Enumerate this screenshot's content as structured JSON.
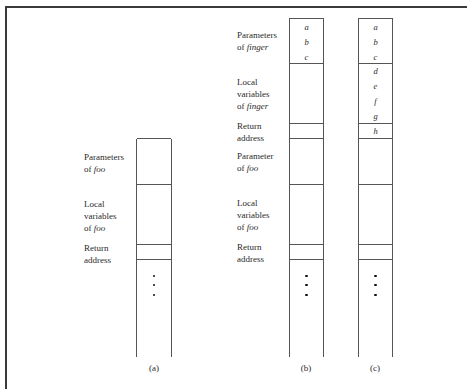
{
  "figure": {
    "columns": [
      {
        "id": "a",
        "caption": "(a)",
        "sections": [
          {
            "label_main": "Parameters",
            "label_prefix": "of ",
            "label_italic": "foo"
          },
          {
            "label_main": "Local\nvariables",
            "label_prefix": "of ",
            "label_italic": "foo"
          },
          {
            "label_main": "Return\naddress",
            "label_prefix": "",
            "label_italic": ""
          }
        ]
      },
      {
        "id": "b",
        "caption": "(b)",
        "sections": [
          {
            "label_main": "Parameters",
            "label_prefix": "of ",
            "label_italic": "finger",
            "vars": [
              "a",
              "b",
              "c"
            ]
          },
          {
            "label_main": "Local\nvariables",
            "label_prefix": "of ",
            "label_italic": "finger"
          },
          {
            "label_main": "Return\naddress",
            "label_prefix": "",
            "label_italic": ""
          },
          {
            "label_main": "Parameter",
            "label_prefix": "of ",
            "label_italic": "foo"
          },
          {
            "label_main": "Local\nvariables",
            "label_prefix": "of ",
            "label_italic": "foo"
          },
          {
            "label_main": "Return\naddress",
            "label_prefix": "",
            "label_italic": ""
          }
        ]
      },
      {
        "id": "c",
        "caption": "(c)",
        "vars_top": [
          "a",
          "b",
          "c"
        ],
        "vars_locals": [
          "d",
          "e",
          "f",
          "g"
        ],
        "vars_return": [
          "h"
        ]
      }
    ],
    "continuation": "⋮"
  }
}
